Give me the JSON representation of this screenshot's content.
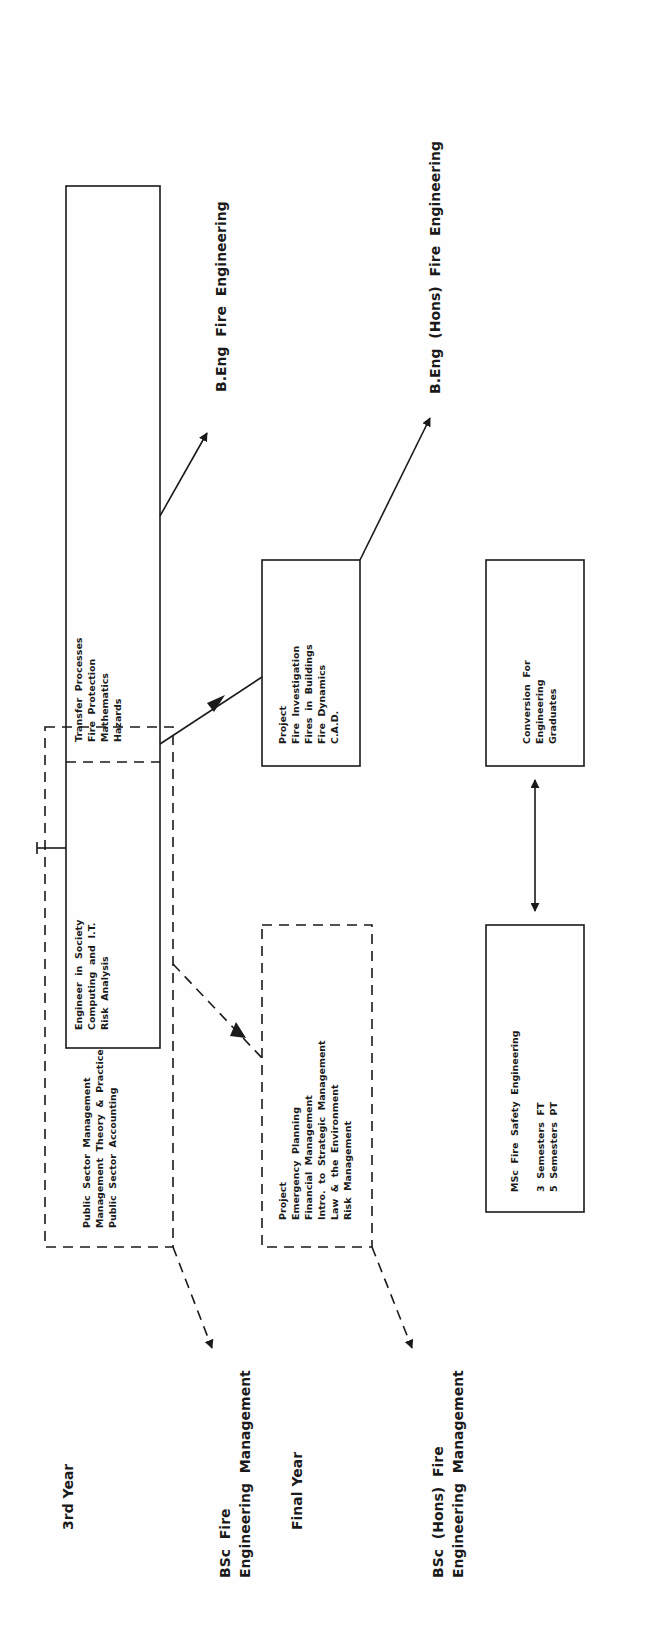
{
  "diagram": {
    "labels": {
      "third_year": "3rd Year",
      "final_year": "Final Year",
      "bsc_fem": [
        "BSc  Fire",
        "Engineering  Management"
      ],
      "bsc_hons_fem": [
        "BSc  (Hons)  Fire",
        "Engineering  Management"
      ],
      "beng_fe": "B.Eng  Fire  Engineering",
      "beng_hons_fe": "B.Eng  (Hons)  Fire  Engineering"
    },
    "boxes": {
      "third_year_management": {
        "style": "dashed",
        "lines": [
          "Public  Sector  Management",
          "Management  Theory  &  Practice",
          "Public  Sector  Accounting"
        ]
      },
      "third_year_shared": {
        "style": "solid",
        "lines": [
          "Engineer  in  Society",
          "Computing  and  I.T.",
          "Risk  Analysis"
        ]
      },
      "third_year_engineering": {
        "style": "solid",
        "lines": [
          "Transfer  Processes",
          "Fire  Protection",
          "Mathematics",
          "Hazards"
        ]
      },
      "final_year_management": {
        "style": "dashed",
        "lines": [
          "Project",
          "Emergency  Planning",
          "Financial  Management",
          "Intro.  to  Strategic  Management",
          "Law  &  the  Environment",
          "Risk  Management"
        ]
      },
      "final_year_engineering": {
        "style": "solid",
        "lines": [
          "Project",
          "Fire  Investigation",
          "Fires  in  Buildings",
          "Fire  Dynamics",
          "C.A.D."
        ]
      },
      "msc": {
        "style": "solid",
        "lines": [
          "MSc  Fire  Safety  Engineering",
          "",
          "3  Semesters  FT",
          "5  Semesters  PT"
        ]
      },
      "conversion": {
        "style": "solid",
        "lines": [
          "Conversion  For",
          "Engineering",
          "Graduates"
        ]
      }
    },
    "connections": [
      {
        "from": "third_year_management",
        "to": "bsc_fem",
        "style": "dashed"
      },
      {
        "from": "third_year_management",
        "to": "final_year_management",
        "style": "dashed"
      },
      {
        "from": "final_year_management",
        "to": "bsc_hons_fem",
        "style": "dashed"
      },
      {
        "from": "third_year_engineering",
        "to": "beng_fe",
        "style": "solid"
      },
      {
        "from": "third_year_engineering",
        "to": "final_year_engineering",
        "style": "solid"
      },
      {
        "from": "final_year_engineering",
        "to": "beng_hons_fe",
        "style": "solid"
      },
      {
        "from": "msc",
        "to": "conversion",
        "style": "solid-bidirectional"
      }
    ]
  }
}
